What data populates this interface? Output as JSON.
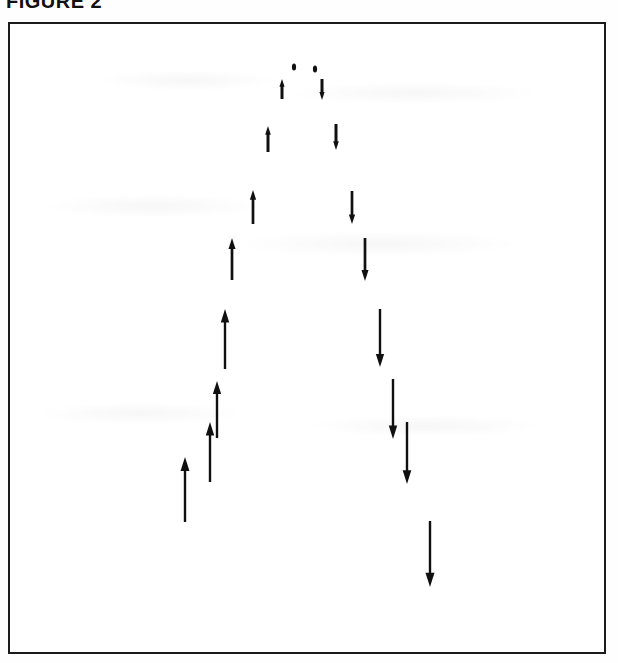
{
  "figure": {
    "label": "FIGURE 2",
    "frame": {
      "x": 8,
      "y": 22,
      "width": 598,
      "height": 632,
      "border_color": "#1b1b1b",
      "background_color": "#ffffff"
    }
  },
  "chart_data": {
    "type": "scatter",
    "title": "FIGURE 2",
    "subtitle": "",
    "xlabel": "",
    "ylabel": "",
    "grid": false,
    "legend": null,
    "annotations": [],
    "axis_ranges": {
      "xlim": [
        0,
        598
      ],
      "ylim": [
        0,
        632
      ]
    },
    "arrow_color": "#101010",
    "series": [
      {
        "name": "ascending-branch-vertical-velocity",
        "direction": "up",
        "count": 8,
        "points": [
          {
            "x": 175,
            "y_tail": 498,
            "y_tip": 433,
            "length": 65
          },
          {
            "x": 200,
            "y_tail": 458,
            "y_tip": 398,
            "length": 60
          },
          {
            "x": 207,
            "y_tail": 414,
            "y_tip": 357,
            "length": 57
          },
          {
            "x": 215,
            "y_tail": 345,
            "y_tip": 285,
            "length": 60
          },
          {
            "x": 222,
            "y_tail": 256,
            "y_tip": 214,
            "length": 42
          },
          {
            "x": 243,
            "y_tail": 200,
            "y_tip": 166,
            "length": 34
          },
          {
            "x": 258,
            "y_tail": 128,
            "y_tip": 102,
            "length": 26
          },
          {
            "x": 272,
            "y_tail": 75,
            "y_tip": 55,
            "length": 20
          }
        ]
      },
      {
        "name": "descending-branch-vertical-velocity",
        "direction": "down",
        "count": 8,
        "points": [
          {
            "x": 312,
            "y_tail": 55,
            "y_tip": 76,
            "length": 21
          },
          {
            "x": 326,
            "y_tail": 100,
            "y_tip": 126,
            "length": 26
          },
          {
            "x": 342,
            "y_tail": 167,
            "y_tip": 200,
            "length": 33
          },
          {
            "x": 355,
            "y_tail": 214,
            "y_tip": 257,
            "length": 43
          },
          {
            "x": 370,
            "y_tail": 285,
            "y_tip": 343,
            "length": 58
          },
          {
            "x": 383,
            "y_tail": 355,
            "y_tip": 415,
            "length": 60
          },
          {
            "x": 397,
            "y_tail": 398,
            "y_tip": 460,
            "length": 62
          },
          {
            "x": 420,
            "y_tail": 497,
            "y_tip": 563,
            "length": 66
          }
        ]
      }
    ],
    "apex_markers": [
      {
        "x": 284,
        "y": 43,
        "size": 5
      },
      {
        "x": 305,
        "y": 45,
        "size": 5
      }
    ]
  }
}
